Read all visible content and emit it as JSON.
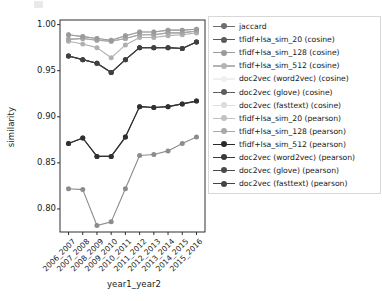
{
  "figure": {
    "background": "#ffffff",
    "plot_area": {
      "left": 60,
      "top": 20,
      "right": 205,
      "bottom": 232
    },
    "axis_color": "#1a1a1a"
  },
  "xlabel": "year1_year2",
  "ylabel": "similarity",
  "yticks": [
    "1.00",
    "0.95",
    "0.90",
    "0.85",
    "0.80"
  ],
  "ytick_values": [
    1.0,
    0.95,
    0.9,
    0.85,
    0.8
  ],
  "xticks": [
    "2006_2007",
    "2007_2008",
    "2008_2009",
    "2009_2010",
    "2010_2011",
    "2011_2012",
    "2012_2013",
    "2013_2014",
    "2014_2015",
    "2015_2016"
  ],
  "legend": {
    "items": [
      {
        "label": "jaccard",
        "color": "#6e6e6e"
      },
      {
        "label": "tfidf+lsa_sim_20 (cosine)",
        "color": "#5a5a5a"
      },
      {
        "label": "tfidf+lsa_sim_128 (cosine)",
        "color": "#9a9a9a"
      },
      {
        "label": "tfidf+lsa_sim_512 (cosine)",
        "color": "#b4b4b4"
      },
      {
        "label": "doc2vec (word2vec) (cosine)",
        "color": "#efefef"
      },
      {
        "label": "doc2vec (glove) (cosine)",
        "color": "#5e5e5e"
      },
      {
        "label": "doc2vec (fasttext) (cosine)",
        "color": "#dcdcdc"
      },
      {
        "label": "tfidf+lsa_sim_20 (pearson)",
        "color": "#c2c2c2"
      },
      {
        "label": "tfidf+lsa_sim_128 (pearson)",
        "color": "#a8a8a8"
      },
      {
        "label": "tfidf+lsa_sim_512 (pearson)",
        "color": "#2a2a2a"
      },
      {
        "label": "doc2vec (word2vec) (pearson)",
        "color": "#3a3a3a"
      },
      {
        "label": "doc2vec (glove) (pearson)",
        "color": "#4a4a4a"
      },
      {
        "label": "doc2vec (fasttext) (pearson)",
        "color": "#444444"
      }
    ]
  },
  "chart_data": {
    "type": "line",
    "title": "",
    "xlabel": "year1_year2",
    "ylabel": "similarity",
    "categories": [
      "2006_2007",
      "2007_2008",
      "2008_2009",
      "2009_2010",
      "2010_2011",
      "2011_2012",
      "2012_2013",
      "2013_2014",
      "2014_2015",
      "2015_2016"
    ],
    "ylim": [
      0.775,
      1.005
    ],
    "xlim": [
      -0.4,
      9.4
    ],
    "grid": false,
    "legend_position": "right-outside",
    "series": [
      {
        "name": "jaccard",
        "color": "#8c8c8c",
        "values": [
          0.822,
          0.821,
          0.782,
          0.786,
          0.822,
          0.858,
          0.859,
          0.863,
          0.871,
          0.878
        ]
      },
      {
        "name": "tfidf+lsa_sim_20 (cosine)",
        "color": "#9a9a9a",
        "values": [
          0.989,
          0.987,
          0.985,
          0.983,
          0.988,
          0.992,
          0.992,
          0.994,
          0.994,
          0.995
        ]
      },
      {
        "name": "tfidf+lsa_sim_128 (cosine)",
        "color": "#a6a6a6",
        "values": [
          0.984,
          0.985,
          0.983,
          0.982,
          0.985,
          0.989,
          0.989,
          0.991,
          0.991,
          0.993
        ]
      },
      {
        "name": "tfidf+lsa_sim_512 (cosine)",
        "color": "#b0b0b0",
        "values": [
          0.982,
          0.979,
          0.975,
          0.964,
          0.978,
          0.986,
          0.986,
          0.988,
          0.989,
          0.991
        ]
      },
      {
        "name": "doc2vec (word2vec) (cosine)",
        "color": "#f2f2f2",
        "values": [
          0.989,
          0.987,
          0.985,
          0.983,
          0.988,
          0.992,
          0.992,
          0.994,
          0.994,
          0.995
        ]
      },
      {
        "name": "doc2vec (glove) (cosine)",
        "color": "#6b6b6b",
        "values": [
          0.966,
          0.962,
          0.958,
          0.948,
          0.962,
          0.975,
          0.975,
          0.975,
          0.974,
          0.981
        ]
      },
      {
        "name": "doc2vec (fasttext) (cosine)",
        "color": "#e2e2e2",
        "values": [
          0.984,
          0.985,
          0.983,
          0.982,
          0.985,
          0.989,
          0.989,
          0.991,
          0.991,
          0.993
        ]
      },
      {
        "name": "tfidf+lsa_sim_20 (pearson)",
        "color": "#c8c8c8",
        "values": [
          0.989,
          0.987,
          0.985,
          0.983,
          0.988,
          0.992,
          0.992,
          0.994,
          0.994,
          0.995
        ]
      },
      {
        "name": "tfidf+lsa_sim_128 (pearson)",
        "color": "#b8b8b8",
        "values": [
          0.984,
          0.985,
          0.983,
          0.982,
          0.985,
          0.989,
          0.989,
          0.991,
          0.991,
          0.993
        ]
      },
      {
        "name": "tfidf+lsa_sim_512 (pearson)",
        "color": "#303030",
        "values": [
          0.871,
          0.877,
          0.857,
          0.857,
          0.878,
          0.911,
          0.91,
          0.911,
          0.914,
          0.917
        ]
      },
      {
        "name": "doc2vec (word2vec) (pearson)",
        "color": "#3a3a3a",
        "values": [
          0.871,
          0.877,
          0.857,
          0.857,
          0.878,
          0.911,
          0.91,
          0.911,
          0.914,
          0.917
        ]
      },
      {
        "name": "doc2vec (glove) (pearson)",
        "color": "#454545",
        "values": [
          0.966,
          0.962,
          0.958,
          0.948,
          0.962,
          0.975,
          0.975,
          0.975,
          0.974,
          0.981
        ]
      },
      {
        "name": "doc2vec (fasttext) (pearson)",
        "color": "#404040",
        "values": [
          0.966,
          0.962,
          0.958,
          0.948,
          0.962,
          0.975,
          0.975,
          0.975,
          0.974,
          0.981
        ]
      }
    ]
  }
}
